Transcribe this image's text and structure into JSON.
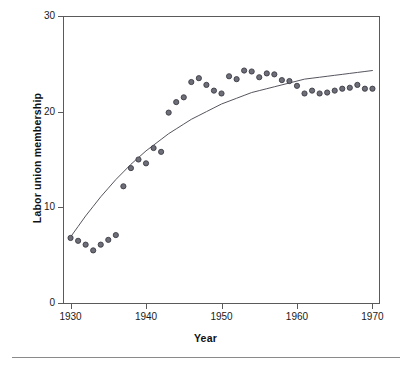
{
  "chart_data": {
    "type": "scatter",
    "title": "",
    "xlabel": "Year",
    "ylabel": "Labor union membership",
    "xlim": [
      1929,
      1971
    ],
    "ylim": [
      0,
      30
    ],
    "xticks": [
      1930,
      1940,
      1950,
      1960,
      1970
    ],
    "yticks": [
      0,
      10,
      20,
      30
    ],
    "grid": false,
    "legend": null,
    "marker": {
      "shape": "circle",
      "fill": "#6e6e78",
      "edge": "#3c3c46",
      "size_px": 5.2
    },
    "fit_line": {
      "name": "fitted curve",
      "color": "#55555f",
      "width_px": 1,
      "x": [
        1930,
        1931,
        1932,
        1933,
        1934,
        1935,
        1936,
        1937,
        1938,
        1939,
        1940,
        1941,
        1942,
        1943,
        1944,
        1945,
        1946,
        1947,
        1948,
        1949,
        1950,
        1951,
        1952,
        1953,
        1954,
        1955,
        1956,
        1957,
        1958,
        1959,
        1960,
        1961,
        1962,
        1963,
        1964,
        1965,
        1966,
        1967,
        1968,
        1969,
        1970
      ],
      "y": [
        6.9,
        8.0,
        9.1,
        10.1,
        11.1,
        12.0,
        12.9,
        13.7,
        14.5,
        15.2,
        15.9,
        16.5,
        17.1,
        17.7,
        18.2,
        18.7,
        19.2,
        19.6,
        20.0,
        20.4,
        20.8,
        21.1,
        21.4,
        21.7,
        22.0,
        22.2,
        22.4,
        22.6,
        22.8,
        23.0,
        23.2,
        23.4,
        23.5,
        23.6,
        23.7,
        23.8,
        23.9,
        24.0,
        24.1,
        24.2,
        24.3
      ]
    },
    "series": [
      {
        "name": "Labor union membership",
        "x": [
          1930,
          1931,
          1932,
          1933,
          1934,
          1935,
          1936,
          1937,
          1938,
          1939,
          1940,
          1941,
          1942,
          1943,
          1944,
          1945,
          1946,
          1947,
          1948,
          1949,
          1950,
          1951,
          1952,
          1953,
          1954,
          1955,
          1956,
          1957,
          1958,
          1959,
          1960,
          1961,
          1962,
          1963,
          1964,
          1965,
          1966,
          1967,
          1968,
          1969,
          1970
        ],
        "y": [
          6.8,
          6.5,
          6.1,
          5.5,
          6.1,
          6.6,
          7.1,
          12.2,
          14.1,
          15.0,
          14.6,
          16.2,
          15.8,
          19.9,
          21.0,
          21.5,
          23.1,
          23.5,
          22.8,
          22.2,
          21.9,
          23.7,
          23.4,
          24.3,
          24.2,
          23.6,
          24.0,
          23.9,
          23.3,
          23.2,
          22.7,
          21.9,
          22.2,
          21.9,
          22.0,
          22.2,
          22.4,
          22.5,
          22.8,
          22.4,
          22.4
        ]
      }
    ],
    "points_table": [
      {
        "year": "1930",
        "value": "6.8"
      },
      {
        "year": "1931",
        "value": "6.5"
      },
      {
        "year": "1932",
        "value": "6.1"
      },
      {
        "year": "1933",
        "value": "5.5"
      },
      {
        "year": "1934",
        "value": "6.1"
      },
      {
        "year": "1935",
        "value": "6.6"
      },
      {
        "year": "1936",
        "value": "7.1"
      },
      {
        "year": "1937",
        "value": "12.2"
      },
      {
        "year": "1938",
        "value": "14.1"
      },
      {
        "year": "1939",
        "value": "15.0"
      },
      {
        "year": "1940",
        "value": "14.6"
      },
      {
        "year": "1941",
        "value": "16.2"
      },
      {
        "year": "1942",
        "value": "15.8"
      },
      {
        "year": "1943",
        "value": "19.9"
      },
      {
        "year": "1944",
        "value": "21.0"
      },
      {
        "year": "1945",
        "value": "21.5"
      },
      {
        "year": "1946",
        "value": "23.1"
      },
      {
        "year": "1947",
        "value": "23.5"
      },
      {
        "year": "1948",
        "value": "22.8"
      },
      {
        "year": "1949",
        "value": "22.2"
      },
      {
        "year": "1950",
        "value": "21.9"
      },
      {
        "year": "1951",
        "value": "23.7"
      },
      {
        "year": "1952",
        "value": "23.4"
      },
      {
        "year": "1953",
        "value": "24.3"
      },
      {
        "year": "1954",
        "value": "24.2"
      },
      {
        "year": "1955",
        "value": "23.6"
      },
      {
        "year": "1956",
        "value": "24.0"
      },
      {
        "year": "1957",
        "value": "23.9"
      },
      {
        "year": "1958",
        "value": "23.3"
      },
      {
        "year": "1959",
        "value": "23.2"
      },
      {
        "year": "1960",
        "value": "22.7"
      },
      {
        "year": "1961",
        "value": "21.9"
      },
      {
        "year": "1962",
        "value": "22.2"
      },
      {
        "year": "1963",
        "value": "21.9"
      },
      {
        "year": "1964",
        "value": "22.0"
      },
      {
        "year": "1965",
        "value": "22.2"
      },
      {
        "year": "1966",
        "value": "22.4"
      },
      {
        "year": "1967",
        "value": "22.5"
      },
      {
        "year": "1968",
        "value": "22.8"
      },
      {
        "year": "1969",
        "value": "22.4"
      },
      {
        "year": "1970",
        "value": "22.4"
      }
    ]
  },
  "axes": {
    "x_title": "Year",
    "y_title": "Labor union membership",
    "x_tick_labels": [
      "1930",
      "1940",
      "1950",
      "1960",
      "1970"
    ],
    "y_tick_labels": [
      "0",
      "10",
      "20",
      "30"
    ]
  },
  "colors": {
    "frame": "#5a5a5a",
    "marker_fill": "#6e6e78",
    "marker_edge": "#3c3c46",
    "curve": "#55555f",
    "text": "#1a1a1a",
    "footer_rule": "#8a8a8a",
    "background": "#ffffff"
  }
}
